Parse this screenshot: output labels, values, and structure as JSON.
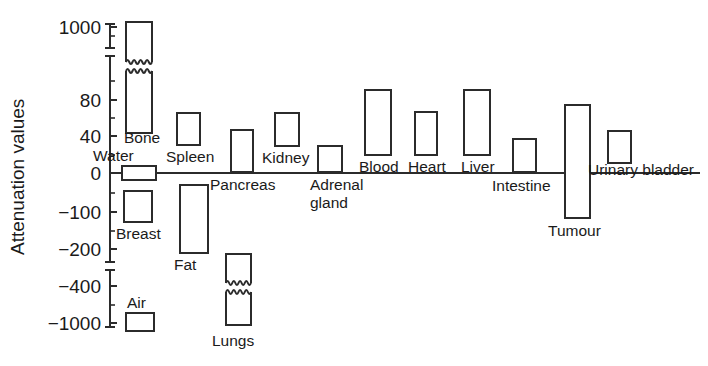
{
  "chart_data": {
    "type": "bar",
    "title": "",
    "subtitle": "",
    "xlabel": "",
    "ylabel": "Attenuation values",
    "legend": [],
    "grid": false,
    "orientation": "vertical",
    "axis_note": "Broken (non-linear / segmented) vertical axis with scale breaks between 80 and 1000, and between -200 and -1000",
    "ytick_labels": [
      "1000",
      "80",
      "40",
      "0",
      "-100",
      "-200",
      "-400",
      "-1000"
    ],
    "ytick_values": [
      1000,
      80,
      40,
      0,
      -100,
      -200,
      -400,
      -1000
    ],
    "ylim": [
      -1000,
      1000
    ],
    "zero_line": 0,
    "categories": [
      "Bone",
      "Water",
      "Breast",
      "Spleen",
      "Fat",
      "Pancreas",
      "Kidney",
      "Lungs",
      "Adrenal gland",
      "Blood",
      "Heart",
      "Liver",
      "Intestine",
      "Tumour",
      "Urinary bladder",
      "Air"
    ],
    "ranges": [
      {
        "name": "Bone",
        "low": 50,
        "high": 1000,
        "broken": true,
        "label": "Bone"
      },
      {
        "name": "Water",
        "low": -8,
        "high": 8,
        "broken": false,
        "label": "Water"
      },
      {
        "name": "Breast",
        "low": -110,
        "high": -40,
        "broken": false,
        "label": "Breast"
      },
      {
        "name": "Spleen",
        "low": 40,
        "high": 75,
        "broken": false,
        "label": "Spleen"
      },
      {
        "name": "Fat",
        "low": -210,
        "high": -10,
        "broken": false,
        "label": "Fat"
      },
      {
        "name": "Pancreas",
        "low": 5,
        "high": 45,
        "broken": false,
        "label": "Pancreas"
      },
      {
        "name": "Kidney",
        "low": 30,
        "high": 60,
        "broken": false,
        "label": "Kidney"
      },
      {
        "name": "Lungs",
        "low": -1000,
        "high": -300,
        "broken": true,
        "label": "Lungs"
      },
      {
        "name": "Adrenal gland",
        "low": 5,
        "high": 30,
        "broken": false,
        "label": "Adrenal gland"
      },
      {
        "name": "Blood",
        "low": 20,
        "high": 85,
        "broken": false,
        "label": "Blood"
      },
      {
        "name": "Heart",
        "low": 22,
        "high": 60,
        "broken": false,
        "label": "Heart"
      },
      {
        "name": "Liver",
        "low": 25,
        "high": 85,
        "broken": false,
        "label": "Liver"
      },
      {
        "name": "Intestine",
        "low": 5,
        "high": 35,
        "broken": false,
        "label": "Intestine"
      },
      {
        "name": "Tumour",
        "low": -125,
        "high": 70,
        "broken": false,
        "label": "Tumour"
      },
      {
        "name": "Urinary bladder",
        "low": 10,
        "high": 40,
        "broken": false,
        "label": "Urinary bladder"
      },
      {
        "name": "Air",
        "low": -1000,
        "high": -950,
        "broken": false,
        "label": "Air"
      }
    ]
  },
  "axis": {
    "ylabel": "Attenuation values",
    "ticks": [
      {
        "label": "1000",
        "y": 27
      },
      {
        "label": "80",
        "y": 100
      },
      {
        "label": "40",
        "y": 136
      },
      {
        "label": "0",
        "y": 173
      },
      {
        "label": "−100",
        "y": 212
      },
      {
        "label": "−200",
        "y": 249
      },
      {
        "label": "−400",
        "y": 286
      },
      {
        "label": "−1000",
        "y": 323
      }
    ]
  },
  "bars": [
    {
      "label": "Bone",
      "x": 126,
      "w": 26,
      "top": 22,
      "bottom": 133,
      "break_y": 62,
      "label_x": 124,
      "label_y": 143,
      "anchor": "start"
    },
    {
      "label": "Water",
      "x": 122,
      "w": 34,
      "top": 166,
      "bottom": 180,
      "label_x": 93,
      "label_y": 161,
      "anchor": "start"
    },
    {
      "label": "Breast",
      "x": 124,
      "w": 28,
      "top": 191,
      "bottom": 222,
      "label_x": 116,
      "label_y": 239,
      "anchor": "start"
    },
    {
      "label": "Spleen",
      "x": 177,
      "w": 23,
      "top": 113,
      "bottom": 145,
      "label_x": 166,
      "label_y": 162,
      "anchor": "start"
    },
    {
      "label": "Fat",
      "x": 180,
      "w": 28,
      "top": 185,
      "bottom": 253,
      "label_x": 174,
      "label_y": 270,
      "anchor": "start"
    },
    {
      "label": "Pancreas",
      "x": 231,
      "w": 22,
      "top": 130,
      "bottom": 172,
      "label_x": 210,
      "label_y": 190,
      "anchor": "start"
    },
    {
      "label": "Kidney",
      "x": 275,
      "w": 24,
      "top": 113,
      "bottom": 146,
      "label_x": 262,
      "label_y": 163,
      "anchor": "start"
    },
    {
      "label": "Lungs",
      "x": 226,
      "w": 25,
      "top": 254,
      "bottom": 325,
      "break_y": 283,
      "label_x": 212,
      "label_y": 346,
      "anchor": "start"
    },
    {
      "label": "Adrenal gland",
      "x": 318,
      "w": 24,
      "top": 146,
      "bottom": 172,
      "label_x": 310,
      "label_y": 190,
      "anchor": "start"
    },
    {
      "label": "Blood",
      "x": 365,
      "w": 26,
      "top": 90,
      "bottom": 155,
      "label_x": 359,
      "label_y": 172,
      "anchor": "start"
    },
    {
      "label": "Heart",
      "x": 415,
      "w": 22,
      "top": 112,
      "bottom": 155,
      "label_x": 408,
      "label_y": 172,
      "anchor": "start"
    },
    {
      "label": "Liver",
      "x": 464,
      "w": 26,
      "top": 90,
      "bottom": 155,
      "label_x": 461,
      "label_y": 172,
      "anchor": "start"
    },
    {
      "label": "Intestine",
      "x": 513,
      "w": 23,
      "top": 139,
      "bottom": 172,
      "label_x": 492,
      "label_y": 191,
      "anchor": "start"
    },
    {
      "label": "Tumour",
      "x": 565,
      "w": 25,
      "top": 105,
      "bottom": 218,
      "label_x": 548,
      "label_y": 236,
      "anchor": "start"
    },
    {
      "label": "Urinary bladder",
      "x": 608,
      "w": 23,
      "top": 131,
      "bottom": 163,
      "label_x": 588,
      "label_y": 175,
      "anchor": "start"
    },
    {
      "label": "Air",
      "x": 126,
      "w": 28,
      "top": 313,
      "bottom": 331,
      "label_x": 127,
      "label_y": 308,
      "anchor": "start"
    }
  ],
  "geometry": {
    "axis_x": 110,
    "axis_top": 24,
    "axis_bottom": 327,
    "zero_y": 173,
    "zero_line_x1": 110,
    "zero_line_x2": 700,
    "axis_break_top_y1": 48,
    "axis_break_top_y2": 56,
    "axis_break_bottom_y1": 262,
    "axis_break_bottom_y2": 270
  },
  "colors": {
    "stroke": "#2b2b2b",
    "text": "#1a1a1a",
    "background": "#ffffff"
  }
}
